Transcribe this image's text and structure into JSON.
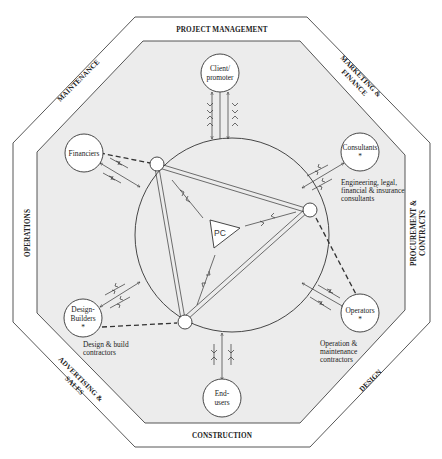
{
  "colors": {
    "line": "#333333",
    "inner_fill": "#ececec",
    "band_fill": "#ffffff",
    "node_fill": "#ffffff"
  },
  "bands": {
    "top": "PROJECT MANAGEMENT",
    "top_right_line1": "MARKETING &",
    "top_right_line2": "FINANCE",
    "right_line1": "PROCUREMENT &",
    "right_line2": "CONTRACTS",
    "bottom_right": "DESIGN",
    "bottom": "CONSTRUCTION",
    "bottom_left_line1": "ADVERTISING &",
    "bottom_left_line2": "SALES",
    "left": "OPERATIONS",
    "top_left": "MAINTENANCE"
  },
  "nodes": {
    "client": {
      "line1": "Client/",
      "line2": "promoter"
    },
    "financiers": {
      "line1": "Financiers"
    },
    "consultants": {
      "line1": "Consultants",
      "marker": "*"
    },
    "operators": {
      "line1": "Operators",
      "marker": "*"
    },
    "design_builders": {
      "line1": "Design-",
      "line2": "Builders",
      "marker": "*"
    },
    "end_users": {
      "line1": "End-",
      "line2": "users"
    },
    "pc": {
      "label": "PC"
    }
  },
  "notes": {
    "consultants": [
      "Engineering, legal,",
      "financial & insurance",
      "consultants"
    ],
    "operators": [
      "Operation &",
      "maintenance",
      "contractors"
    ],
    "design_builders": [
      "Design & build",
      "contractors"
    ]
  }
}
